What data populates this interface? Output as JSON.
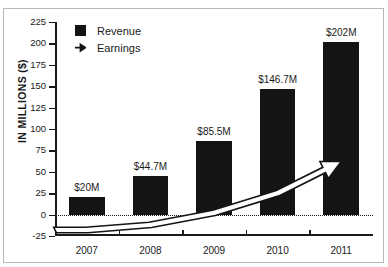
{
  "chart_data": {
    "type": "bar",
    "title": "",
    "subtitle": "",
    "xlabel": "",
    "ylabel": "IN MILLIONS ($)",
    "categories": [
      "2007",
      "2008",
      "2009",
      "2010",
      "2011"
    ],
    "ylim": [
      -25,
      225
    ],
    "yticks": [
      225,
      200,
      175,
      150,
      125,
      100,
      75,
      50,
      25,
      0,
      -25
    ],
    "ytick_labels": [
      "225",
      "200",
      "175",
      "150",
      "125",
      "100",
      "75",
      "50",
      "25",
      "0",
      "-25"
    ],
    "grid": false,
    "legend_position": "top-left",
    "zero_baseline": true,
    "series": [
      {
        "name": "Revenue",
        "type": "bar",
        "color": "#141414",
        "values": [
          20,
          44.7,
          85.5,
          146.7,
          202
        ],
        "point_labels": [
          "$20M",
          "$44.7M",
          "$85.5M",
          "$146.7M",
          "$202M"
        ]
      },
      {
        "name": "Earnings",
        "type": "line",
        "style": "outlined-arrow",
        "color": "#141414",
        "values": [
          -18,
          -12,
          2,
          25,
          62
        ],
        "point_labels": [
          "",
          "",
          "",
          "",
          ""
        ]
      }
    ],
    "legend": [
      {
        "label": "Revenue",
        "marker": "filled-square",
        "color": "#141414"
      },
      {
        "label": "Earnings",
        "marker": "arrow-right",
        "color": "#141414"
      }
    ],
    "annotations": []
  },
  "colors": {
    "bar": "#141414",
    "axis": "#1a1a1a",
    "background": "#ffffff",
    "frame": "#b9b9b9"
  }
}
